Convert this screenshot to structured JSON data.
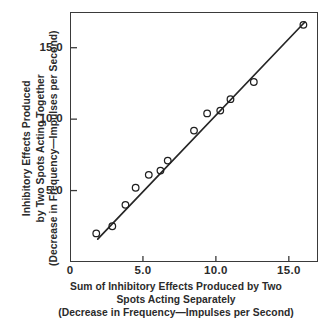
{
  "chart_data": {
    "type": "scatter",
    "title": "",
    "xlabel": "Sum of Inhibitory Effects Produced by Two Spots Acting Separately (Decrease in Frequency—Impulses per Second)",
    "ylabel": "Inhibitory Effects Produced by Two Spots Acting Together (Decrease in Frequency—Impulses per Second)",
    "xlim": [
      0,
      17.0
    ],
    "ylim": [
      0,
      17.5
    ],
    "grid": false,
    "legend": "none",
    "marker": "open-circle",
    "x": [
      1.8,
      2.9,
      3.8,
      4.5,
      5.4,
      6.2,
      6.7,
      8.5,
      9.4,
      10.3,
      11.0,
      12.6,
      16.0
    ],
    "y": [
      2.0,
      2.5,
      4.0,
      5.2,
      6.1,
      6.4,
      7.1,
      9.2,
      10.4,
      10.6,
      11.4,
      12.6,
      16.6
    ],
    "points": [
      {
        "x": 1.8,
        "y": 2.0
      },
      {
        "x": 2.9,
        "y": 2.5
      },
      {
        "x": 3.8,
        "y": 4.0
      },
      {
        "x": 4.5,
        "y": 5.2
      },
      {
        "x": 5.4,
        "y": 6.1
      },
      {
        "x": 6.2,
        "y": 6.4
      },
      {
        "x": 6.7,
        "y": 7.1
      },
      {
        "x": 8.5,
        "y": 9.2
      },
      {
        "x": 9.4,
        "y": 10.4
      },
      {
        "x": 10.3,
        "y": 10.6
      },
      {
        "x": 11.0,
        "y": 11.4
      },
      {
        "x": 12.6,
        "y": 12.6
      },
      {
        "x": 16.0,
        "y": 16.6
      }
    ],
    "fit_line": {
      "type": "line",
      "x_start": 1.9,
      "y_start": 1.6,
      "x_end": 16.1,
      "y_end": 16.8
    },
    "xticks": [
      {
        "value": 0,
        "label": "0"
      },
      {
        "value": 5,
        "label": "5.0"
      },
      {
        "value": 10,
        "label": "10.0"
      },
      {
        "value": 15,
        "label": "15.0"
      }
    ],
    "yticks": [
      {
        "value": 5,
        "label": "5.0"
      },
      {
        "value": 10,
        "label": "10.0"
      },
      {
        "value": 15,
        "label": "15.0"
      }
    ]
  },
  "axes": {
    "x_caption_lines": [
      "Sum of Inhibitory Effects Produced by Two",
      "Spots Acting Separately",
      "(Decrease in Frequency—Impulses per Second)"
    ],
    "y_caption_lines": [
      "Inhibitory Effects Produced",
      "by Two Spots Acting Together",
      "(Decrease in Frequency—Impulses per Second)"
    ]
  },
  "style": {
    "ink_color": "#2b2b2b",
    "frame_color": "#3a3a3a",
    "background": "#ffffff"
  }
}
